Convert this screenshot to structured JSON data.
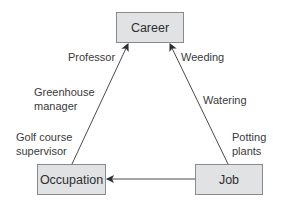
{
  "diagram": {
    "nodes": [
      {
        "id": "career",
        "label": "Career"
      },
      {
        "id": "occupation",
        "label": "Occupation"
      },
      {
        "id": "job",
        "label": "Job"
      }
    ],
    "edges": [
      {
        "from": "occupation",
        "to": "career"
      },
      {
        "from": "job",
        "to": "career"
      },
      {
        "from": "job",
        "to": "occupation"
      }
    ],
    "left_edge_labels": {
      "professor": "Professor",
      "greenhouse_line1": "Greenhouse",
      "greenhouse_line2": "manager",
      "golf_line1": "Golf course",
      "golf_line2": "supervisor"
    },
    "right_edge_labels": {
      "weeding": "Weeding",
      "watering": "Watering",
      "potting_line1": "Potting",
      "potting_line2": "plants"
    },
    "colors": {
      "node_fill": "#e1e2e4",
      "node_border": "#8a8a8e",
      "line": "#4a4a4e",
      "text": "#3a3a3c"
    }
  }
}
